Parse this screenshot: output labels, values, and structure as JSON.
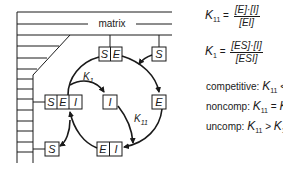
{
  "diagram": {
    "matrix_label": "matrix",
    "boxes": {
      "se_top": [
        "S",
        "E"
      ],
      "s_top": [
        "S"
      ],
      "sei": [
        "S",
        "E",
        "I"
      ],
      "i": [
        "I"
      ],
      "e": [
        "E"
      ],
      "s_bottom": [
        "S"
      ],
      "ei": [
        "E",
        "I"
      ]
    },
    "arrow_labels": {
      "k1": {
        "base": "K",
        "sub": "1"
      },
      "k11": {
        "base": "K",
        "sub": "11"
      }
    }
  },
  "equations": {
    "k11": {
      "lhs_base": "K",
      "lhs_sub": "11",
      "equals": "=",
      "numerator": "[E]·[I]",
      "denominator": "[EI]"
    },
    "k1": {
      "lhs_base": "K",
      "lhs_sub": "1",
      "equals": "=",
      "numerator": "[ES]·[I]",
      "denominator": "[ESI]"
    }
  },
  "conditions": [
    {
      "label": "competitive:",
      "a_base": "K",
      "a_sub": "11",
      "op": "<",
      "b_base": "K",
      "b_sub": "1"
    },
    {
      "label": "noncomp:",
      "a_base": "K",
      "a_sub": "11",
      "op": "=",
      "b_base": "K",
      "b_sub": "1"
    },
    {
      "label": "uncomp:",
      "a_base": "K",
      "a_sub": "11",
      "op": ">",
      "b_base": "K",
      "b_sub": "1"
    }
  ]
}
